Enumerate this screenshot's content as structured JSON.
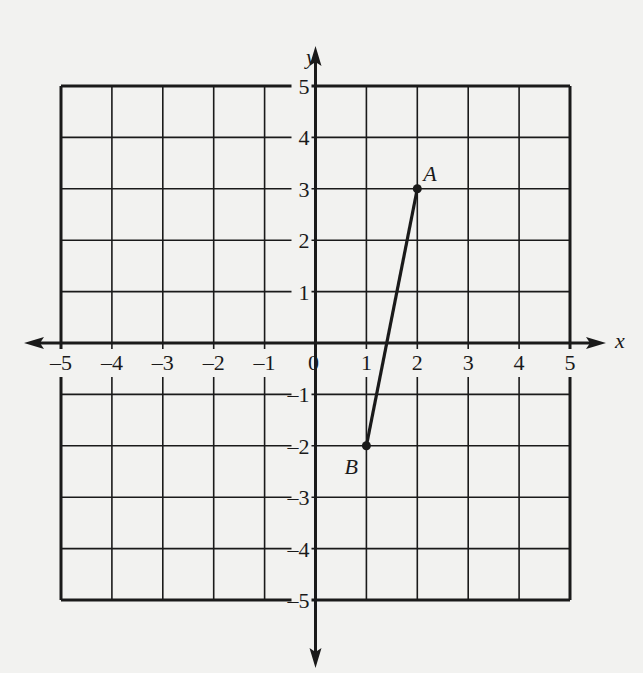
{
  "chart_data": {
    "type": "line",
    "title": "",
    "xlabel": "x",
    "ylabel": "y",
    "xlim": [
      -5,
      5
    ],
    "ylim": [
      -5,
      5
    ],
    "grid": true,
    "x_ticks": [
      "-5",
      "-4",
      "-3",
      "-2",
      "-1",
      "0",
      "1",
      "2",
      "3",
      "4",
      "5"
    ],
    "y_ticks": [
      "5",
      "4",
      "3",
      "2",
      "1",
      "-1",
      "-2",
      "-3",
      "-4",
      "-5"
    ],
    "points": [
      {
        "label": "A",
        "x": 2,
        "y": 3
      },
      {
        "label": "B",
        "x": 1,
        "y": -2
      }
    ],
    "series": [
      {
        "name": "segment AB",
        "x": [
          1,
          2
        ],
        "y": [
          -2,
          3
        ]
      }
    ]
  },
  "labels": {
    "x_axis": "x",
    "y_axis": "y",
    "origin": "0",
    "point_a": "A",
    "point_b": "B"
  },
  "colors": {
    "ink": "#1a1a1a",
    "paper": "#f2f2f0"
  }
}
